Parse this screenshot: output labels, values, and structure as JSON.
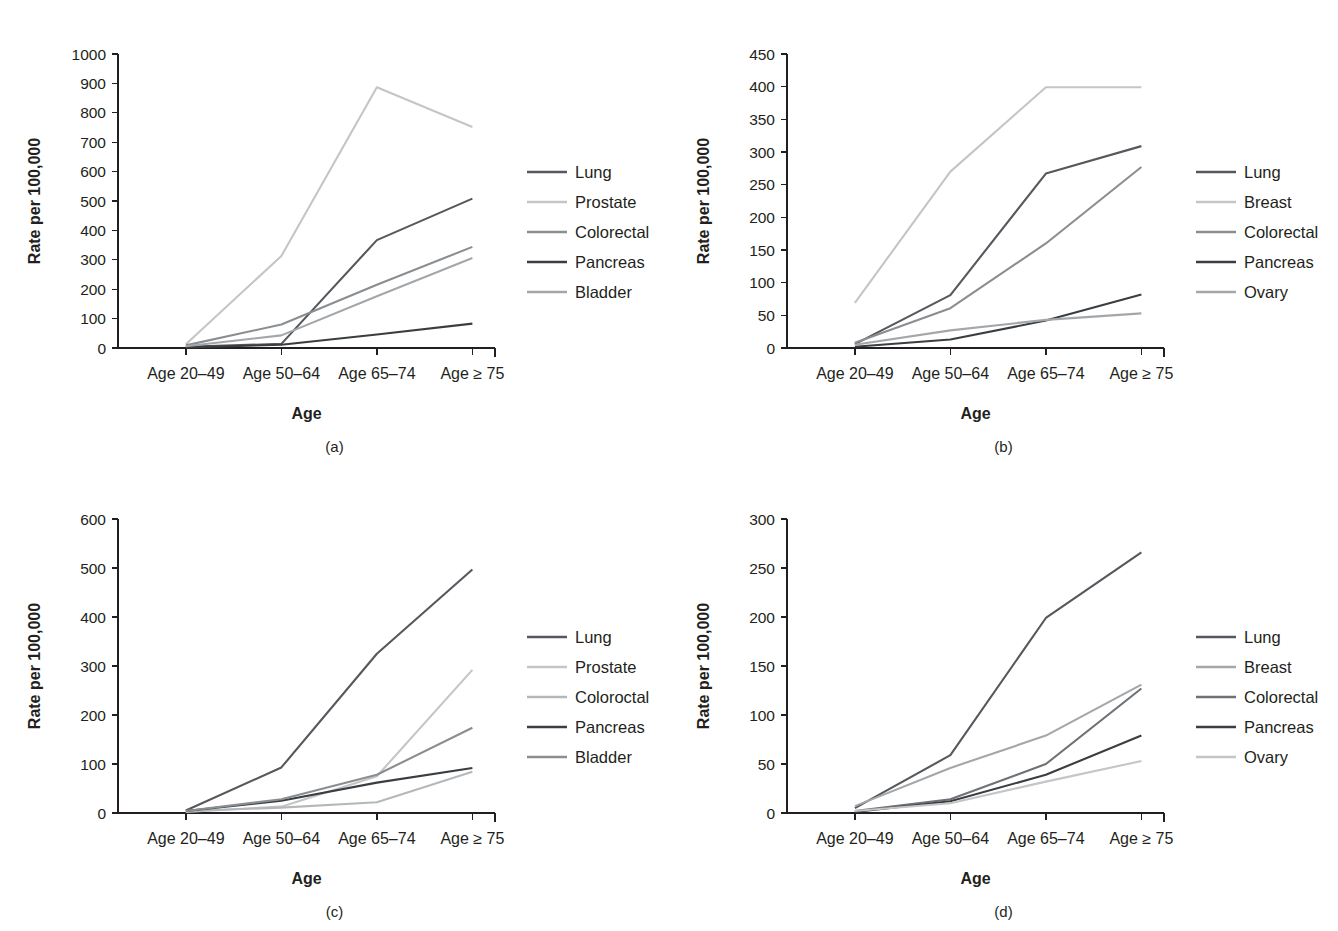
{
  "figure": {
    "panels": [
      {
        "id": "a",
        "caption": "(a)",
        "chart_data": {
          "type": "line",
          "title": "",
          "xlabel": "Age",
          "ylabel": "Rate per 100,000",
          "categories": [
            "Age 20–49",
            "Age 50–64",
            "Age 65–74",
            "Age ≥ 75"
          ],
          "ylim": [
            0,
            1000
          ],
          "yticks": [
            0,
            100,
            200,
            300,
            400,
            500,
            600,
            700,
            800,
            900,
            1000
          ],
          "grid": false,
          "legend_position": "right",
          "series": [
            {
              "name": "Lung",
              "values": [
                4,
                14,
                367,
                508
              ],
              "color": "#55585c"
            },
            {
              "name": "Prostate",
              "values": [
                13,
                313,
                887,
                752
              ],
              "color": "#c3c5c7"
            },
            {
              "name": "Colorectal",
              "values": [
                9,
                80,
                215,
                344
              ],
              "color": "#8b8e91"
            },
            {
              "name": "Pancreas",
              "values": [
                2,
                11,
                46,
                83
              ],
              "color": "#3a3d41"
            },
            {
              "name": "Bladder",
              "values": [
                6,
                43,
                176,
                306
              ],
              "color": "#a4a7aa"
            }
          ]
        }
      },
      {
        "id": "b",
        "caption": "(b)",
        "chart_data": {
          "type": "line",
          "title": "",
          "xlabel": "Age",
          "ylabel": "Rate per 100,000",
          "categories": [
            "Age 20–49",
            "Age 50–64",
            "Age 65–74",
            "Age ≥ 75"
          ],
          "ylim": [
            0,
            450
          ],
          "yticks": [
            0,
            50,
            100,
            150,
            200,
            250,
            300,
            350,
            400,
            450
          ],
          "grid": false,
          "legend_position": "right",
          "series": [
            {
              "name": "Lung",
              "values": [
                6,
                81,
                267,
                309
              ],
              "color": "#55585c"
            },
            {
              "name": "Breast",
              "values": [
                69,
                270,
                399,
                399
              ],
              "color": "#c3c5c7"
            },
            {
              "name": "Colorectal",
              "values": [
                8,
                61,
                160,
                277
              ],
              "color": "#8b8e91"
            },
            {
              "name": "Pancreas",
              "values": [
                2,
                13,
                42,
                82
              ],
              "color": "#3a3d41"
            },
            {
              "name": "Ovary",
              "values": [
                5,
                27,
                43,
                53
              ],
              "color": "#a4a7aa"
            }
          ]
        }
      },
      {
        "id": "c",
        "caption": "(c)",
        "chart_data": {
          "type": "line",
          "title": "",
          "xlabel": "Age",
          "ylabel": "Rate per 100,000",
          "categories": [
            "Age 20–49",
            "Age 50–64",
            "Age 65–74",
            "Age ≥ 75"
          ],
          "ylim": [
            0,
            600
          ],
          "yticks": [
            0,
            100,
            200,
            300,
            400,
            500,
            600
          ],
          "grid": false,
          "legend_position": "right",
          "series": [
            {
              "name": "Lung",
              "values": [
                5,
                93,
                325,
                497
              ],
              "color": "#55585c"
            },
            {
              "name": "Prostate",
              "values": [
                2,
                13,
                75,
                292
              ],
              "color": "#c3c5c7"
            },
            {
              "name": "Coloroctal",
              "values": [
                4,
                11,
                22,
                84
              ],
              "color": "#b5b8ba"
            },
            {
              "name": "Pancreas",
              "values": [
                4,
                25,
                62,
                92
              ],
              "color": "#3a3d41"
            },
            {
              "name": "Bladder",
              "values": [
                4,
                28,
                78,
                174
              ],
              "color": "#8b8e91"
            }
          ]
        }
      },
      {
        "id": "d",
        "caption": "(d)",
        "chart_data": {
          "type": "line",
          "title": "",
          "xlabel": "Age",
          "ylabel": "Rate per 100,000",
          "categories": [
            "Age 20–49",
            "Age 50–64",
            "Age 65–74",
            "Age ≥ 75"
          ],
          "ylim": [
            0,
            300
          ],
          "yticks": [
            0,
            50,
            100,
            150,
            200,
            250,
            300
          ],
          "grid": false,
          "legend_position": "right",
          "series": [
            {
              "name": "Lung",
              "values": [
                5,
                59,
                199,
                266
              ],
              "color": "#55585c"
            },
            {
              "name": "Breast",
              "values": [
                7,
                46,
                79,
                131
              ],
              "color": "#a4a7aa"
            },
            {
              "name": "Colorectal",
              "values": [
                2,
                14,
                50,
                127
              ],
              "color": "#6e7175"
            },
            {
              "name": "Pancreas",
              "values": [
                1,
                12,
                39,
                79
              ],
              "color": "#3a3d41"
            },
            {
              "name": "Ovary",
              "values": [
                2,
                10,
                32,
                53
              ],
              "color": "#c3c5c7"
            }
          ]
        }
      }
    ]
  }
}
